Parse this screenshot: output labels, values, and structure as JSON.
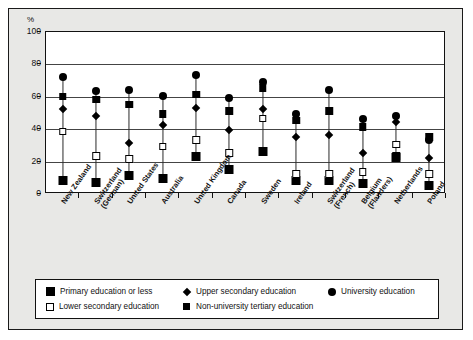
{
  "axis": {
    "unit_label": "%",
    "y_ticks": [
      0,
      20,
      40,
      60,
      80,
      100
    ]
  },
  "legend": {
    "items": [
      {
        "key": "primary",
        "label": "Primary education or less",
        "marker": "filled-square-large"
      },
      {
        "key": "upper",
        "label": "Upper secondary education",
        "marker": "filled-diamond"
      },
      {
        "key": "university",
        "label": "University education",
        "marker": "filled-circle"
      },
      {
        "key": "lower",
        "label": "Lower secondary education",
        "marker": "open-square"
      },
      {
        "key": "nonuniv",
        "label": "Non-university tertiary education",
        "marker": "filled-square"
      }
    ]
  },
  "chart_data": {
    "type": "scatter",
    "title": "",
    "xlabel": "",
    "ylabel": "%",
    "ylim": [
      0,
      100
    ],
    "grid": true,
    "legend_position": "bottom",
    "categories": [
      "New Zealand",
      "Switzerland (German)",
      "United States",
      "Australia",
      "United Kingdom",
      "Canada",
      "Sweden",
      "Ireland",
      "Switzerland (French)",
      "Belgium (Flanders)",
      "Netherlands",
      "Poland"
    ],
    "category_lines": [
      [
        "New Zealand"
      ],
      [
        "Switzerland",
        "(German)"
      ],
      [
        "United States"
      ],
      [
        "Australia"
      ],
      [
        "United Kingdom"
      ],
      [
        "Canada"
      ],
      [
        "Sweden"
      ],
      [
        "Ireland"
      ],
      [
        "Switzerland",
        "(French)"
      ],
      [
        "Belgium",
        "(Flanders)"
      ],
      [
        "Netherlands"
      ],
      [
        "Poland"
      ]
    ],
    "series": [
      {
        "name": "Primary education or less",
        "key": "primary",
        "marker": "filled-square-large",
        "values": [
          8,
          7,
          11,
          9,
          23,
          15,
          26,
          8,
          8,
          6,
          22,
          5
        ]
      },
      {
        "name": "Lower secondary education",
        "key": "lower",
        "marker": "open-square",
        "values": [
          38,
          23,
          21,
          29,
          33,
          25,
          46,
          12,
          12,
          13,
          30,
          12
        ]
      },
      {
        "name": "Upper secondary education",
        "key": "upper",
        "marker": "filled-diamond",
        "values": [
          52,
          48,
          31,
          42,
          53,
          39,
          52,
          35,
          36,
          25,
          44,
          22
        ]
      },
      {
        "name": "Non-university tertiary education",
        "key": "nonuniv",
        "marker": "filled-square",
        "values": [
          60,
          58,
          55,
          49,
          61,
          51,
          65,
          45,
          51,
          41,
          23,
          35
        ]
      },
      {
        "name": "University education",
        "key": "university",
        "marker": "filled-circle",
        "values": [
          72,
          63,
          64,
          60,
          73,
          59,
          69,
          49,
          64,
          46,
          48,
          33
        ]
      }
    ]
  }
}
